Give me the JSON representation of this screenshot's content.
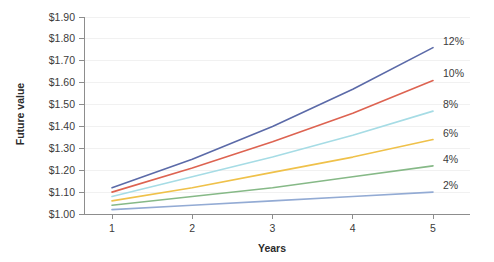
{
  "chart_data": {
    "type": "line",
    "title": "",
    "xlabel": "Years",
    "ylabel": "Future value",
    "x": [
      1,
      2,
      3,
      4,
      5
    ],
    "x_tick_labels": [
      "1",
      "2",
      "3",
      "4",
      "5"
    ],
    "xlim": [
      0.75,
      5.25
    ],
    "ylim": [
      1.0,
      1.9
    ],
    "y_ticks": [
      1.0,
      1.1,
      1.2,
      1.3,
      1.4,
      1.5,
      1.6,
      1.7,
      1.8,
      1.9
    ],
    "y_tick_labels": [
      "$1.00",
      "$1.10",
      "$1.20",
      "$1.30",
      "$1.40",
      "$1.50",
      "$1.60",
      "$1.70",
      "$1.80",
      "$1.90"
    ],
    "grid": "horizontal",
    "legend_position": "right-inline-end-of-line",
    "series": [
      {
        "name": "12%",
        "label": "12%",
        "color": "#5b6aa8",
        "values": [
          1.12,
          1.25,
          1.4,
          1.57,
          1.76
        ]
      },
      {
        "name": "10%",
        "label": "10%",
        "color": "#dd6351",
        "values": [
          1.1,
          1.21,
          1.33,
          1.46,
          1.61
        ]
      },
      {
        "name": "8%",
        "label": "8%",
        "color": "#a6dce5",
        "values": [
          1.08,
          1.17,
          1.26,
          1.36,
          1.47
        ]
      },
      {
        "name": "6%",
        "label": "6%",
        "color": "#efc14a",
        "values": [
          1.06,
          1.12,
          1.19,
          1.26,
          1.34
        ]
      },
      {
        "name": "4%",
        "label": "4%",
        "color": "#86b987",
        "values": [
          1.04,
          1.08,
          1.12,
          1.17,
          1.22
        ]
      },
      {
        "name": "2%",
        "label": "2%",
        "color": "#93abd4",
        "values": [
          1.02,
          1.04,
          1.06,
          1.08,
          1.1
        ]
      }
    ]
  }
}
